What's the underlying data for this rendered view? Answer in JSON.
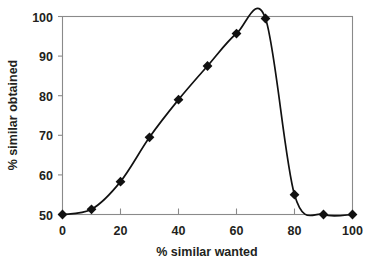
{
  "chart_data": {
    "type": "line",
    "title": "",
    "xlabel": "% similar wanted",
    "ylabel": "% similar obtained",
    "xlim": [
      0,
      100
    ],
    "ylim": [
      50,
      100
    ],
    "xticks": [
      0,
      20,
      40,
      60,
      80,
      100
    ],
    "yticks": [
      50,
      60,
      70,
      80,
      90,
      100
    ],
    "xtick_labels": [
      "0",
      "20",
      "40",
      "60",
      "80",
      "100"
    ],
    "ytick_labels": [
      "50",
      "60",
      "70",
      "80",
      "90",
      "100"
    ],
    "grid": false,
    "legend": false,
    "legend_position": "none",
    "marker": "diamond",
    "line_color": "#111111",
    "marker_color": "#111111",
    "axis_color": "#8a8a8a",
    "background_color": "#ffffff",
    "x": [
      0,
      10,
      20,
      30,
      40,
      50,
      60,
      70,
      80,
      90,
      100
    ],
    "values": [
      50,
      51.3,
      58.3,
      69.5,
      79,
      87.5,
      95.7,
      99.5,
      55,
      50,
      50
    ],
    "series": [
      {
        "name": "% similar obtained",
        "x": [
          0,
          10,
          20,
          30,
          40,
          50,
          60,
          70,
          80,
          90,
          100
        ],
        "values": [
          50,
          51.3,
          58.3,
          69.5,
          79,
          87.5,
          95.7,
          99.5,
          55,
          50,
          50
        ]
      }
    ],
    "annotations": []
  },
  "axes": {
    "x_title": "% similar wanted",
    "y_title": "% similar obtained"
  }
}
